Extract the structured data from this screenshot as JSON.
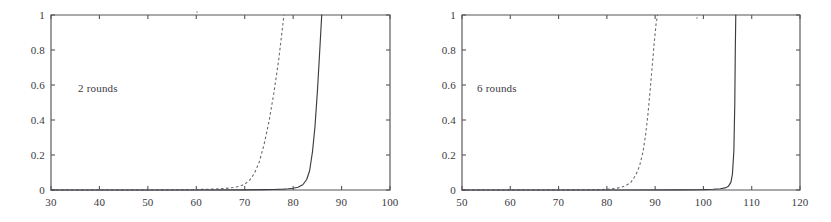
{
  "figure": {
    "background": "#ffffff",
    "ink_color": "#3c3c42",
    "panel_count": 2
  },
  "chart_data": [
    {
      "type": "line",
      "title": "",
      "annotation": "2 rounds",
      "xlabel": "",
      "ylabel": "",
      "xlim": [
        30,
        100
      ],
      "ylim": [
        0,
        1
      ],
      "xticks": [
        30,
        40,
        50,
        60,
        70,
        80,
        90,
        100
      ],
      "xticklabels": [
        "30",
        "40",
        "50",
        "60",
        "70",
        "80",
        "90",
        "100"
      ],
      "yticks": [
        0,
        0.2,
        0.4,
        0.6,
        0.8,
        1
      ],
      "yticklabels": [
        "0",
        "0.2",
        "0.4",
        "0.6",
        "0.8",
        "1"
      ],
      "grid": false,
      "legend": "none",
      "series": [
        {
          "name": "dashed-curve",
          "style": "dashed",
          "color": "#6a6a70",
          "x": [
            30,
            50,
            58,
            62,
            64,
            66,
            67,
            68,
            69,
            70,
            71,
            72,
            73,
            74,
            75,
            76,
            77,
            77.6,
            78.1
          ],
          "y": [
            0,
            0,
            0.002,
            0.004,
            0.006,
            0.009,
            0.012,
            0.016,
            0.022,
            0.033,
            0.055,
            0.095,
            0.16,
            0.26,
            0.39,
            0.55,
            0.74,
            0.88,
            1.0
          ]
        },
        {
          "name": "solid-curve",
          "style": "solid",
          "color": "#3c3c42",
          "x": [
            30,
            60,
            70,
            74,
            76,
            78,
            79,
            80,
            81,
            82,
            82.8,
            83.4,
            84,
            84.5,
            85,
            85.4,
            85.7,
            85.9
          ],
          "y": [
            0,
            0,
            0.001,
            0.002,
            0.003,
            0.005,
            0.007,
            0.01,
            0.016,
            0.03,
            0.06,
            0.11,
            0.22,
            0.36,
            0.56,
            0.75,
            0.9,
            1.0
          ]
        }
      ]
    },
    {
      "type": "line",
      "title": "",
      "annotation": "6 rounds",
      "xlabel": "",
      "ylabel": "",
      "xlim": [
        50,
        120
      ],
      "ylim": [
        0,
        1
      ],
      "xticks": [
        50,
        60,
        70,
        80,
        90,
        100,
        110,
        120
      ],
      "xticklabels": [
        "50",
        "60",
        "70",
        "80",
        "90",
        "100",
        "110",
        "120"
      ],
      "yticks": [
        0,
        0.2,
        0.4,
        0.6,
        0.8,
        1
      ],
      "yticklabels": [
        "0",
        "0.2",
        "0.4",
        "0.6",
        "0.8",
        "1"
      ],
      "grid": false,
      "legend": "none",
      "series": [
        {
          "name": "dashed-curve",
          "style": "dashed",
          "color": "#6a6a70",
          "x": [
            50,
            70,
            78,
            80,
            81,
            82,
            83,
            84,
            85,
            86,
            86.8,
            87.5,
            88,
            88.5,
            89,
            89.4,
            89.8,
            90.2,
            90.5
          ],
          "y": [
            0,
            0,
            0.002,
            0.004,
            0.006,
            0.01,
            0.016,
            0.026,
            0.045,
            0.085,
            0.14,
            0.22,
            0.31,
            0.43,
            0.58,
            0.71,
            0.84,
            0.95,
            1.0
          ]
        },
        {
          "name": "solid-curve",
          "style": "solid",
          "color": "#3c3c42",
          "x": [
            50,
            85,
            95,
            100,
            102,
            103.5,
            104.5,
            105.2,
            105.7,
            106.0,
            106.3,
            106.5,
            106.6,
            106.7
          ],
          "y": [
            0,
            0,
            0.001,
            0.002,
            0.004,
            0.007,
            0.012,
            0.022,
            0.045,
            0.09,
            0.22,
            0.5,
            0.8,
            1.0
          ]
        }
      ]
    }
  ],
  "panels": [
    {
      "id": "left",
      "annotation": "2 rounds",
      "xticklabels": [
        "30",
        "40",
        "50",
        "60",
        "70",
        "80",
        "90",
        "100"
      ],
      "yticklabels": [
        "0",
        "0.2",
        "0.4",
        "0.6",
        "0.8",
        "1"
      ]
    },
    {
      "id": "right",
      "annotation": "6 rounds",
      "xticklabels": [
        "50",
        "60",
        "70",
        "80",
        "90",
        "100",
        "110",
        "120"
      ],
      "yticklabels": [
        "0",
        "0.2",
        "0.4",
        "0.6",
        "0.8",
        "1"
      ]
    }
  ]
}
